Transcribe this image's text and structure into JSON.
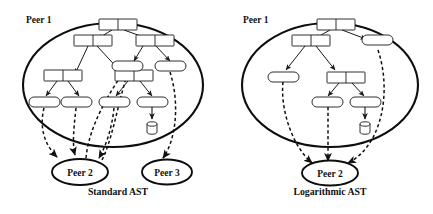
{
  "figure": {
    "type": "diagram",
    "background_color": "#ffffff",
    "stroke_color": "#111111"
  },
  "panels": [
    {
      "id": "standard",
      "caption": "Standard AST",
      "boundary_label": "Peer 1",
      "external_peers": [
        {
          "label": "Peer 2"
        },
        {
          "label": "Peer 3"
        }
      ],
      "internal_node_count": 4,
      "leaf_node_count": 6,
      "database_count": 1,
      "dashed_link_count": 6
    },
    {
      "id": "logarithmic",
      "caption": "Logarithmic AST",
      "boundary_label": "Peer 1",
      "external_peers": [
        {
          "label": "Peer 2"
        }
      ],
      "internal_node_count": 3,
      "leaf_node_count": 4,
      "database_count": 1,
      "dashed_link_count": 3
    }
  ]
}
